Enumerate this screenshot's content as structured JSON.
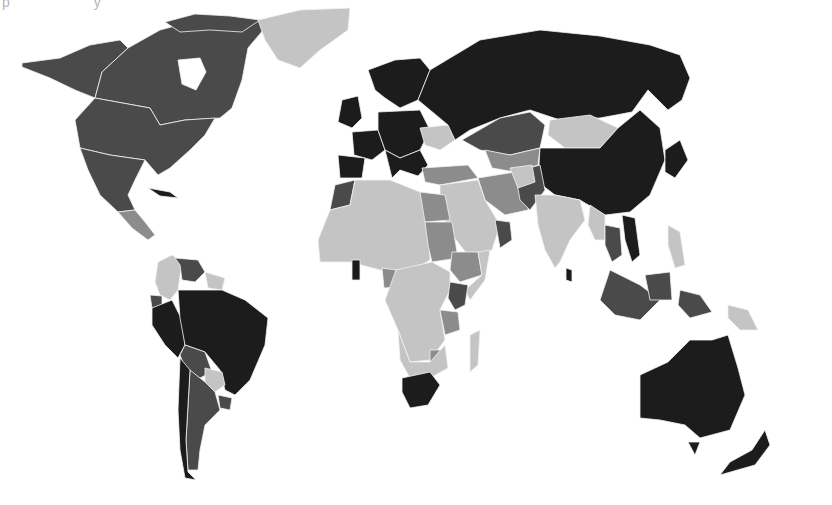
{
  "map": {
    "type": "choropleth",
    "projection": "world (Pacific-cut, Greenland top-center)",
    "header_fragment": "p y",
    "legend": [],
    "shades": {
      "level_4_darkest": "#1c1c1c",
      "level_3_dark": "#4a4a4a",
      "level_2_medium": "#8c8c8c",
      "level_1_light": "#c4c4c4",
      "background": "#ffffff",
      "border": "#f2f2f2"
    },
    "regions": [
      {
        "name": "Alaska / USA / Canada",
        "level": 3
      },
      {
        "name": "Greenland",
        "level": 1
      },
      {
        "name": "Mexico",
        "level": 3
      },
      {
        "name": "Central America",
        "level": 2
      },
      {
        "name": "Cuba",
        "level": 4
      },
      {
        "name": "Colombia",
        "level": 1
      },
      {
        "name": "Venezuela",
        "level": 3
      },
      {
        "name": "Guyana / Suriname",
        "level": 1
      },
      {
        "name": "Ecuador",
        "level": 3
      },
      {
        "name": "Peru",
        "level": 4
      },
      {
        "name": "Brazil",
        "level": 4
      },
      {
        "name": "Bolivia",
        "level": 3
      },
      {
        "name": "Paraguay",
        "level": 1
      },
      {
        "name": "Chile",
        "level": 4
      },
      {
        "name": "Argentina",
        "level": 3
      },
      {
        "name": "Uruguay",
        "level": 3
      },
      {
        "name": "Western & Northern Europe",
        "level": 4
      },
      {
        "name": "Ukraine",
        "level": 1
      },
      {
        "name": "Russia",
        "level": 4
      },
      {
        "name": "Kazakhstan",
        "level": 3
      },
      {
        "name": "Mongolia",
        "level": 1
      },
      {
        "name": "China",
        "level": 4
      },
      {
        "name": "Japan / Korea",
        "level": 4
      },
      {
        "name": "Turkey",
        "level": 2
      },
      {
        "name": "Iran",
        "level": 2
      },
      {
        "name": "Saudi Arabia / Middle East",
        "level": 1
      },
      {
        "name": "Oman / UAE",
        "level": 3
      },
      {
        "name": "Pakistan",
        "level": 3
      },
      {
        "name": "India",
        "level": 1
      },
      {
        "name": "Sri Lanka",
        "level": 4
      },
      {
        "name": "Thailand",
        "level": 3
      },
      {
        "name": "Vietnam",
        "level": 4
      },
      {
        "name": "Malaysia / Indonesia",
        "level": 3
      },
      {
        "name": "Philippines",
        "level": 1
      },
      {
        "name": "Papua New Guinea",
        "level": 1
      },
      {
        "name": "Morocco",
        "level": 3
      },
      {
        "name": "North & West Africa",
        "level": 1
      },
      {
        "name": "Egypt",
        "level": 2
      },
      {
        "name": "Sudan",
        "level": 2
      },
      {
        "name": "Ethiopia",
        "level": 2
      },
      {
        "name": "Ghana",
        "level": 4
      },
      {
        "name": "Cameroon",
        "level": 2
      },
      {
        "name": "Kenya",
        "level": 3
      },
      {
        "name": "Tanzania",
        "level": 2
      },
      {
        "name": "Central & Southern Africa",
        "level": 1
      },
      {
        "name": "Zimbabwe",
        "level": 2
      },
      {
        "name": "South Africa",
        "level": 4
      },
      {
        "name": "Madagascar",
        "level": 1
      },
      {
        "name": "Australia",
        "level": 4
      },
      {
        "name": "New Zealand",
        "level": 4
      }
    ]
  }
}
